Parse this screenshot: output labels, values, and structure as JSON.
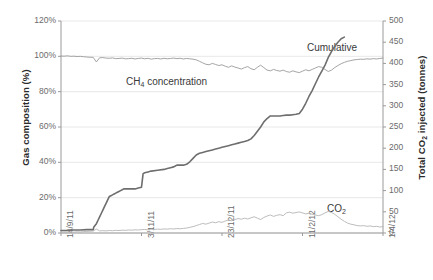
{
  "chart_data": {
    "type": "line",
    "title": "",
    "xlabel": "",
    "ylabel": "Gas composition (%)",
    "y2label": "Total CO2 injected (tonnes)",
    "grid": true,
    "legend": "inline-annotations",
    "x_tick_labels": [
      "14/9/11",
      "3/11/11",
      "23/12/11",
      "11/2/12",
      "1/4/12"
    ],
    "x_tick_positions": [
      0,
      0.25,
      0.5,
      0.75,
      1.0
    ],
    "y_left_ticks": [
      "0%",
      "20%",
      "40%",
      "60%",
      "80%",
      "100%",
      "120%"
    ],
    "y_left_values": [
      0,
      20,
      40,
      60,
      80,
      100,
      120
    ],
    "ylim": [
      0,
      120
    ],
    "y_right_ticks": [
      "0",
      "50",
      "100",
      "150",
      "200",
      "250",
      "300",
      "350",
      "400",
      "450",
      "500"
    ],
    "y_right_values": [
      0,
      50,
      100,
      150,
      200,
      250,
      300,
      350,
      400,
      450,
      500
    ],
    "y2lim": [
      0,
      500
    ],
    "series": [
      {
        "name": "CH4 concentration",
        "label_html": "CH<sub>4</sub> concentration",
        "axis": "left",
        "color": "#9a9a9a",
        "unit": "%",
        "x": [
          0.0,
          0.01,
          0.02,
          0.03,
          0.04,
          0.05,
          0.06,
          0.07,
          0.08,
          0.09,
          0.1,
          0.11,
          0.12,
          0.13,
          0.14,
          0.15,
          0.16,
          0.17,
          0.18,
          0.19,
          0.2,
          0.21,
          0.22,
          0.23,
          0.24,
          0.25,
          0.26,
          0.27,
          0.28,
          0.29,
          0.3,
          0.31,
          0.32,
          0.33,
          0.34,
          0.35,
          0.36,
          0.37,
          0.38,
          0.39,
          0.4,
          0.41,
          0.42,
          0.43,
          0.44,
          0.45,
          0.46,
          0.47,
          0.48,
          0.49,
          0.5,
          0.51,
          0.52,
          0.53,
          0.54,
          0.55,
          0.56,
          0.57,
          0.58,
          0.59,
          0.6,
          0.61,
          0.62,
          0.63,
          0.64,
          0.65,
          0.66,
          0.67,
          0.68,
          0.69,
          0.7,
          0.71,
          0.72,
          0.73,
          0.74,
          0.75,
          0.76,
          0.77,
          0.78,
          0.79,
          0.8,
          0.81,
          0.82,
          0.83,
          0.84,
          0.85,
          0.86,
          0.87,
          0.88,
          0.89,
          0.9,
          0.91,
          0.92,
          0.93,
          0.94,
          0.95,
          0.96,
          0.97,
          0.98,
          0.99,
          1.0
        ],
        "y": [
          100.2,
          100.1,
          100.3,
          100.0,
          100.1,
          99.9,
          100.0,
          99.8,
          99.6,
          99.5,
          99.4,
          96.8,
          99.2,
          99.3,
          99.0,
          98.9,
          99.1,
          98.7,
          98.8,
          99.0,
          98.6,
          98.7,
          98.9,
          98.5,
          98.8,
          99.0,
          98.6,
          98.9,
          98.4,
          98.7,
          98.8,
          98.5,
          98.9,
          98.6,
          98.8,
          99.0,
          98.7,
          98.9,
          98.5,
          98.8,
          98.6,
          98.4,
          98.0,
          97.2,
          96.3,
          95.5,
          95.2,
          96.0,
          95.4,
          94.8,
          95.2,
          94.4,
          93.8,
          94.6,
          93.9,
          93.4,
          92.8,
          93.6,
          94.2,
          93.0,
          92.4,
          93.8,
          95.0,
          93.6,
          92.2,
          91.8,
          92.6,
          92.0,
          91.6,
          92.2,
          91.4,
          91.0,
          91.8,
          91.2,
          90.8,
          91.6,
          92.4,
          91.8,
          92.6,
          93.4,
          94.2,
          93.8,
          92.6,
          91.4,
          92.2,
          93.6,
          94.8,
          95.8,
          96.6,
          97.2,
          97.6,
          98.0,
          98.2,
          98.4,
          98.3,
          98.6,
          98.4,
          98.7,
          98.5,
          98.8,
          99.0
        ]
      },
      {
        "name": "CO2",
        "label_html": "CO<sub>2</sub>",
        "axis": "left",
        "color": "#b4b4b4",
        "unit": "%",
        "x": [
          0.0,
          0.01,
          0.02,
          0.03,
          0.04,
          0.05,
          0.06,
          0.07,
          0.08,
          0.09,
          0.1,
          0.11,
          0.12,
          0.13,
          0.14,
          0.15,
          0.16,
          0.17,
          0.18,
          0.19,
          0.2,
          0.21,
          0.22,
          0.23,
          0.24,
          0.25,
          0.26,
          0.27,
          0.28,
          0.29,
          0.3,
          0.31,
          0.32,
          0.33,
          0.34,
          0.35,
          0.36,
          0.37,
          0.38,
          0.39,
          0.4,
          0.41,
          0.42,
          0.43,
          0.44,
          0.45,
          0.46,
          0.47,
          0.48,
          0.49,
          0.5,
          0.51,
          0.52,
          0.53,
          0.54,
          0.55,
          0.56,
          0.57,
          0.58,
          0.59,
          0.6,
          0.61,
          0.62,
          0.63,
          0.64,
          0.65,
          0.66,
          0.67,
          0.68,
          0.69,
          0.7,
          0.71,
          0.72,
          0.73,
          0.74,
          0.75,
          0.76,
          0.77,
          0.78,
          0.79,
          0.8,
          0.81,
          0.82,
          0.83,
          0.84,
          0.85,
          0.86,
          0.87,
          0.88,
          0.89,
          0.9,
          0.91,
          0.92,
          0.93,
          0.94,
          0.95,
          0.96,
          0.97,
          0.98,
          0.99,
          1.0
        ],
        "y": [
          0.4,
          0.5,
          0.4,
          0.6,
          0.5,
          0.7,
          0.6,
          0.8,
          0.9,
          1.0,
          1.1,
          2.2,
          1.2,
          1.3,
          1.2,
          1.4,
          1.3,
          1.5,
          1.4,
          1.6,
          1.5,
          1.7,
          1.6,
          1.8,
          1.7,
          1.9,
          2.0,
          1.8,
          2.1,
          2.0,
          2.2,
          2.1,
          2.3,
          2.2,
          2.4,
          2.3,
          2.5,
          2.4,
          2.6,
          2.8,
          3.2,
          3.6,
          4.2,
          4.8,
          5.4,
          5.0,
          5.6,
          6.2,
          5.8,
          6.4,
          6.0,
          6.8,
          7.4,
          6.9,
          7.6,
          8.2,
          7.8,
          8.4,
          7.9,
          8.6,
          9.2,
          8.4,
          7.6,
          8.8,
          9.6,
          10.2,
          9.4,
          10.0,
          10.4,
          9.8,
          11.4,
          11.8,
          11.2,
          11.6,
          11.9,
          11.4,
          10.8,
          11.2,
          10.6,
          10.2,
          9.8,
          10.4,
          11.4,
          12.2,
          11.6,
          10.6,
          9.2,
          7.8,
          6.6,
          5.6,
          5.0,
          4.6,
          4.2,
          4.0,
          4.2,
          3.8,
          4.0,
          3.6,
          3.8,
          3.4,
          3.6
        ]
      },
      {
        "name": "Cumulative",
        "label_html": "Cumulative",
        "axis": "right",
        "color": "#6e6e6e",
        "unit": "tonnes",
        "x": [
          0.0,
          0.02,
          0.04,
          0.06,
          0.08,
          0.1,
          0.102,
          0.11,
          0.115,
          0.12,
          0.125,
          0.13,
          0.135,
          0.14,
          0.145,
          0.15,
          0.155,
          0.16,
          0.165,
          0.17,
          0.175,
          0.18,
          0.185,
          0.19,
          0.195,
          0.2,
          0.21,
          0.22,
          0.23,
          0.24,
          0.25,
          0.255,
          0.26,
          0.27,
          0.28,
          0.3,
          0.32,
          0.33,
          0.34,
          0.35,
          0.355,
          0.36,
          0.365,
          0.37,
          0.38,
          0.39,
          0.4,
          0.41,
          0.42,
          0.43,
          0.44,
          0.45,
          0.46,
          0.47,
          0.48,
          0.49,
          0.5,
          0.51,
          0.52,
          0.53,
          0.54,
          0.55,
          0.56,
          0.57,
          0.58,
          0.59,
          0.6,
          0.61,
          0.62,
          0.63,
          0.64,
          0.65,
          0.66,
          0.67,
          0.68,
          0.69,
          0.7,
          0.71,
          0.72,
          0.73,
          0.74,
          0.75,
          0.76,
          0.77,
          0.78,
          0.79,
          0.8,
          0.81,
          0.82,
          0.83,
          0.84,
          0.85,
          0.86,
          0.87,
          0.88
        ],
        "y": [
          6,
          6,
          7,
          7,
          8,
          8,
          14,
          22,
          30,
          38,
          46,
          54,
          62,
          70,
          78,
          86,
          88,
          90,
          92,
          94,
          96,
          98,
          100,
          102,
          104,
          104,
          104,
          104,
          104,
          106,
          108,
          140,
          142,
          144,
          146,
          148,
          150,
          152,
          154,
          156,
          158,
          160,
          160,
          160,
          160,
          162,
          168,
          176,
          184,
          188,
          190,
          192,
          194,
          196,
          198,
          200,
          202,
          204,
          206,
          208,
          210,
          212,
          214,
          216,
          218,
          222,
          230,
          240,
          250,
          262,
          270,
          276,
          276,
          276,
          276,
          277,
          278,
          278,
          279,
          280,
          282,
          292,
          306,
          322,
          336,
          352,
          368,
          382,
          396,
          414,
          428,
          440,
          450,
          458,
          462
        ]
      }
    ],
    "annotations": [
      {
        "name": "ch4-label",
        "text": "CH4 concentration",
        "x_px": 126,
        "y_px": 76
      },
      {
        "name": "cumulative-label",
        "text": "Cumulative",
        "x_px": 307,
        "y_px": 42
      },
      {
        "name": "co2-label",
        "text": "CO2",
        "x_px": 327,
        "y_px": 203
      }
    ],
    "colors": {
      "grid": "#e2e2e2",
      "axis": "#9a9a9a",
      "ch4": "#9a9a9a",
      "co2": "#b4b4b4",
      "cumulative": "#6e6e6e",
      "text": "#6b6b6b",
      "title_text": "#2b2b2b",
      "background": "#ffffff"
    },
    "plot_box": {
      "left": 61,
      "top": 21,
      "right": 383,
      "bottom": 233
    }
  }
}
